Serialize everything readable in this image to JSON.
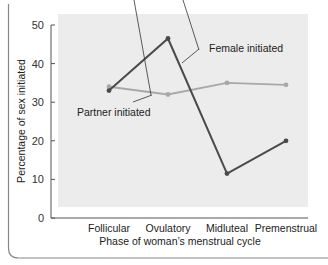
{
  "chart_data": {
    "type": "line",
    "title": "",
    "xlabel": "Phase of woman’s menstrual cycle",
    "ylabel": "Percentage of sex initiated",
    "categories": [
      "Follicular",
      "Ovulatory",
      "Midluteal",
      "Premenstrual"
    ],
    "ylim": [
      0,
      50
    ],
    "yticks": [
      0,
      10,
      20,
      30,
      40,
      50
    ],
    "grid": false,
    "legend": "inline annotations",
    "series": [
      {
        "name": "Female initiated",
        "values": [
          33,
          46.5,
          11.5,
          20
        ],
        "color": "#4a4a4a"
      },
      {
        "name": "Partner initiated",
        "values": [
          34,
          32,
          35,
          34.5
        ],
        "color": "#a8a8a8"
      }
    ],
    "annotations": [
      {
        "text": "Female initiated",
        "series": 0
      },
      {
        "text": "Partner initiated",
        "series": 1
      }
    ],
    "plot_background": "#ececec"
  }
}
